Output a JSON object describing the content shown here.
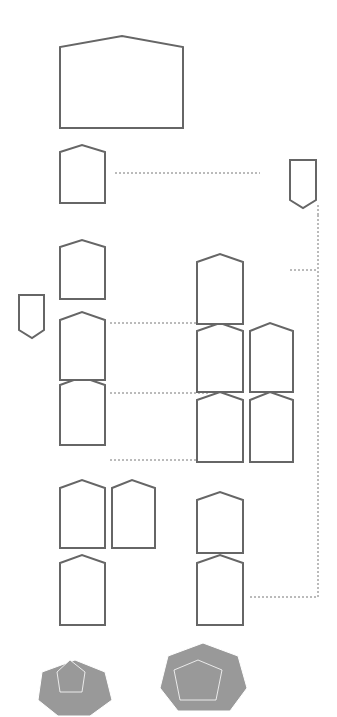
{
  "top_row": {
    "node_badge": {
      "lines": [
        "黑客攻擊",
        "智能合約",
        "Yield"
      ],
      "num": "2435"
    },
    "boxes": [
      {
        "lines": [
          "閃電貸",
          "5億美元DAI",
          "MakerDao"
        ]
      },
      {
        "lines": [
          "轉換為yUSD",
          "(yUSD Vault Token)",
          "Curve/Yearn"
        ]
      },
      {
        "lines": [
          "5億美元",
          "crYUSD"
        ]
      },
      {
        "lines": [
          "5億美元",
          "crYUSD"
        ]
      },
      {
        "lines": [
          "5億美元",
          "yUSD"
        ]
      }
    ],
    "sub_box": {
      "lines": [
        "存入CREAM",
        "得到5億美元",
        "crYUSD"
      ]
    },
    "repay_flag": {
      "lines": [
        "歸還閃電貸",
        "5億美元DAI"
      ]
    }
  },
  "bottom_row": {
    "node_badge": {
      "lines": [
        "黑客攻擊",
        "智能合約",
        "Cre"
      ],
      "num": "3436"
    },
    "boxes": [
      {
        "lines": [
          "閃電貸",
          "20億美元ETH",
          "AAVE"
        ]
      },
      {
        "lines": [
          "ETH存入",
          "Cream"
        ]
      },
      {
        "lines": [
          "從Cream",
          "借貸5億美元",
          "yUSD"
        ]
      },
      {
        "lines": [
          "借貸5億美元",
          "yUSD"
        ]
      },
      {
        "lines": [
          "借貸5億美元",
          "yUSD"
        ]
      }
    ],
    "sub_boxes": [
      {
        "lines": [
          "存入Cream",
          "得到5億美元",
          "crYUSD"
        ]
      },
      {
        "lines": [
          "存入Cream",
          "得到5億美元",
          "crYUSD"
        ]
      }
    ],
    "repay_flag": {
      "lines": [
        "歸還閃電貸",
        "20億美元ETH"
      ]
    }
  },
  "center_block": {
    "lines_top": [
      "操縱",
      "yUSD",
      "價格"
    ],
    "multiplier": "×2",
    "lines_bottom": [
      "抵押物yUSD",
      "現在值",
      "30億美元"
    ]
  },
  "take_box": {
    "lines": [
      "取走",
      "20億美元ETH"
    ]
  },
  "big_box": {
    "lines": [
      "借空Cream的",
      "可借資產",
      "共1.3億美元"
    ]
  },
  "info_box": {
    "title": "價格操縱yUSD×2",
    "left": [
      "yUSD Vault",
      "之前狀況",
      "",
      "質押",
      "800萬美元",
      "yUSD",
      "流動資產",
      "800萬美元",
      "yCRV"
    ],
    "right": [
      "yUSD Vault",
      "之後狀況",
      "",
      "質押",
      "800萬美元",
      "yUSD",
      "流動資產",
      "1 600萬美元",
      "yCRV"
    ],
    "footer": "存入800萬美元yCRV"
  },
  "annotations": {
    "exploit": [
      "利用Cream 決定抵押物",
      "價格的漏洞操縱價格"
    ],
    "exploit_note": [
      "yUSD 爲yUSD Value Token，爲專案",
      "DUSD資產的可用的yUSD"
    ],
    "top_note_1": "歸還後，抵押物值30億美元",
    "top_note_2": "歸還後，抵押物值15億美元",
    "bottom_note": "借貸來的52.4萬枚ETH中，6 000 枚ETH轉帳給1inch，用於攻擊"
  }
}
